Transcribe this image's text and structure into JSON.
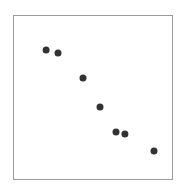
{
  "chart_data": {
    "type": "scatter",
    "title": "",
    "xlabel": "",
    "ylabel": "",
    "xlim": [
      0,
      1
    ],
    "ylim": [
      0,
      1
    ],
    "grid": false,
    "legend": null,
    "x_ticks": [],
    "y_ticks": [],
    "series": [
      {
        "name": "points",
        "color": "#333333",
        "marker": "circle",
        "points": [
          {
            "x": 0.208,
            "y": 0.787
          },
          {
            "x": 0.283,
            "y": 0.768
          },
          {
            "x": 0.44,
            "y": 0.616
          },
          {
            "x": 0.547,
            "y": 0.439
          },
          {
            "x": 0.648,
            "y": 0.287
          },
          {
            "x": 0.704,
            "y": 0.274
          },
          {
            "x": 0.887,
            "y": 0.171
          }
        ]
      }
    ]
  },
  "style": {
    "frame_color": "#9a9a9a",
    "point_color": "#333333",
    "background": "#ffffff"
  }
}
